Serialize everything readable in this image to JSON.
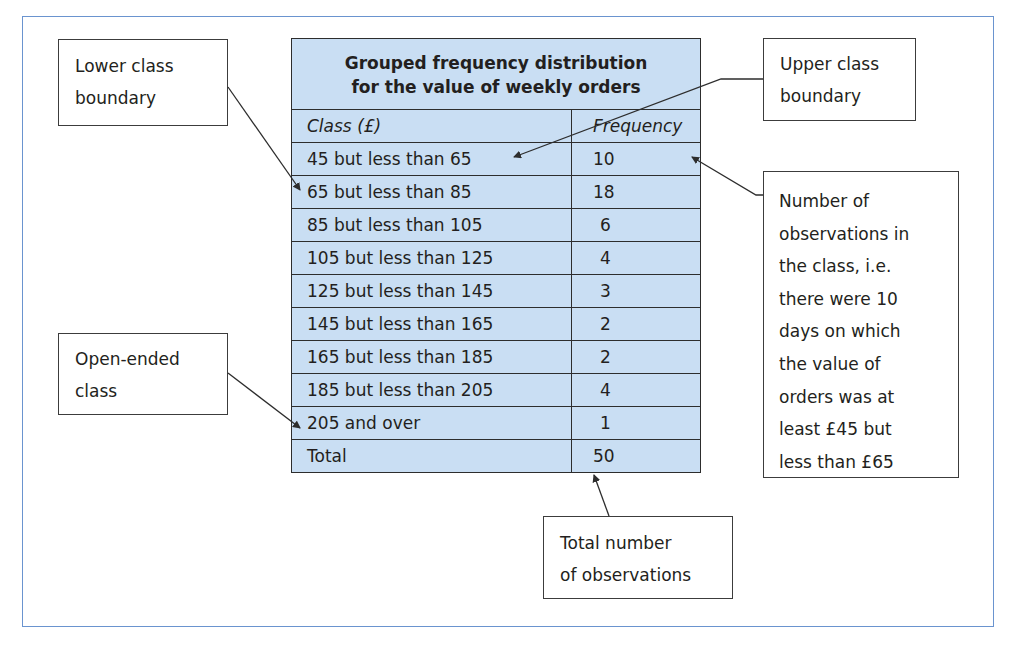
{
  "table": {
    "title_line1": "Grouped frequency distribution",
    "title_line2": "for the value of weekly orders",
    "col_class": "Class (£)",
    "col_frequency": "Frequency",
    "rows": [
      {
        "class": "45 but less than 65",
        "frequency": "10"
      },
      {
        "class": "65 but less than 85",
        "frequency": "18"
      },
      {
        "class": "85 but less than 105",
        "frequency": "6"
      },
      {
        "class": "105 but less than 125",
        "frequency": "4"
      },
      {
        "class": "125 but less than 145",
        "frequency": "3"
      },
      {
        "class": "145 but less than 165",
        "frequency": "2"
      },
      {
        "class": "165 but less than 185",
        "frequency": "2"
      },
      {
        "class": "185 but less than 205",
        "frequency": "4"
      },
      {
        "class": "205 and over",
        "frequency": "1"
      }
    ],
    "total_label": "Total",
    "total_value": "50"
  },
  "callouts": {
    "lower_boundary": {
      "line1": "Lower class",
      "line2": "boundary"
    },
    "upper_boundary": {
      "line1": "Upper class",
      "line2": "boundary"
    },
    "open_ended": {
      "line1": "Open-ended",
      "line2": "class"
    },
    "total_obs": {
      "line1": "Total number",
      "line2": "of observations"
    },
    "observations": {
      "lines": [
        "Number of",
        "observations in",
        "the class, i.e.",
        "there were 10",
        "days on which",
        "the value of",
        "orders was at",
        "least £45 but",
        "less than £65"
      ]
    }
  },
  "colors": {
    "table_fill": "#c9def3",
    "frame_border": "#6a94cf",
    "line": "#2d2d2d"
  }
}
